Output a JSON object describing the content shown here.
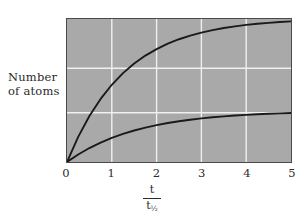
{
  "figure": {
    "background_color": "#ffffff",
    "plot_background_color": "#a9a9a9",
    "grid_color": "#f0f0f0",
    "curve_color": "#1a1a1a",
    "frame_color": "#4a4a4a"
  },
  "axis": {
    "ylabel_line1": "Number",
    "ylabel_line2": "of atoms",
    "xlabel_numerator": "t",
    "xlabel_denominator": "t",
    "xlabel_denominator_subscript": "½"
  },
  "chart_data": {
    "type": "line",
    "title": "",
    "xlabel": "t / t½",
    "ylabel": "Number of atoms",
    "xlim": [
      0,
      5
    ],
    "ylim": [
      0,
      1
    ],
    "xticks": [
      "0",
      "1",
      "2",
      "3",
      "4",
      "5"
    ],
    "xtick_values": [
      0,
      1,
      2,
      3,
      4,
      5
    ],
    "yticks": [],
    "grid": true,
    "grid_x_values": [
      1,
      2,
      3,
      4
    ],
    "grid_y_values": [
      0.3448,
      0.6552
    ],
    "legend": "none",
    "series": [
      {
        "name": "upper-curve",
        "description": "Saturating exponential rising to high plateau",
        "x": [
          0,
          0.25,
          0.5,
          0.75,
          1,
          1.25,
          1.5,
          1.75,
          2,
          2.25,
          2.5,
          2.75,
          3,
          3.25,
          3.5,
          3.75,
          4,
          4.25,
          4.5,
          4.75,
          5
        ],
        "y": [
          0,
          0.1761,
          0.3214,
          0.4412,
          0.54,
          0.6214,
          0.6886,
          0.744,
          0.7897,
          0.8274,
          0.8585,
          0.8841,
          0.9052,
          0.9226,
          0.937,
          0.9488,
          0.9585,
          0.9666,
          0.9732,
          0.9786,
          0.9831
        ]
      },
      {
        "name": "lower-curve",
        "description": "Saturating exponential rising to low plateau",
        "x": [
          0,
          0.25,
          0.5,
          0.75,
          1,
          1.25,
          1.5,
          1.75,
          2,
          2.25,
          2.5,
          2.75,
          3,
          3.25,
          3.5,
          3.75,
          4,
          4.25,
          4.5,
          4.75,
          5
        ],
        "y": [
          0,
          0.0527,
          0.0976,
          0.1359,
          0.1686,
          0.1964,
          0.2202,
          0.2404,
          0.2577,
          0.2724,
          0.285,
          0.2957,
          0.3048,
          0.3126,
          0.3192,
          0.3249,
          0.3297,
          0.3338,
          0.3373,
          0.3403,
          0.3428
        ]
      }
    ]
  }
}
